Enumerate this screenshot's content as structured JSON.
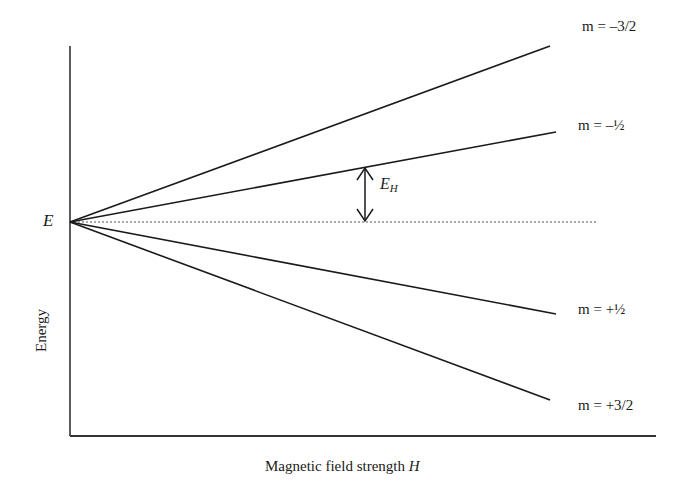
{
  "diagram": {
    "type": "energy-level-splitting",
    "xlabel": "Magnetic field strength",
    "xlabel_var": "H",
    "ylabel": "Energy",
    "origin_label": "E",
    "gap_label": "E",
    "gap_label_sub": "H",
    "levels": [
      {
        "label": "m = –3/2",
        "direction": "up",
        "slope": "steep"
      },
      {
        "label": "m = –½",
        "direction": "up",
        "slope": "shallow"
      },
      {
        "label": "m = +½",
        "direction": "down",
        "slope": "shallow"
      },
      {
        "label": "m = +3/2",
        "direction": "down",
        "slope": "steep"
      }
    ],
    "reference_line": "dotted, zero-field energy E",
    "colors": {
      "lines": "#1a1a1a",
      "background": "#ffffff"
    }
  }
}
